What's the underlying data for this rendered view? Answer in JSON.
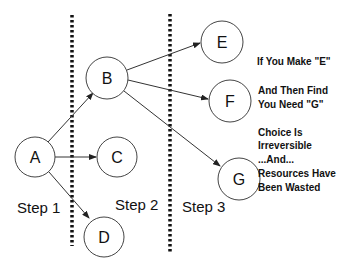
{
  "nodes": [
    {
      "id": "A",
      "label": "A",
      "cx": 35,
      "cy": 157,
      "r": 20
    },
    {
      "id": "B",
      "label": "B",
      "cx": 107,
      "cy": 78,
      "r": 21
    },
    {
      "id": "C",
      "label": "C",
      "cx": 117,
      "cy": 157,
      "r": 20
    },
    {
      "id": "D",
      "label": "D",
      "cx": 104,
      "cy": 237,
      "r": 20
    },
    {
      "id": "E",
      "label": "E",
      "cx": 222,
      "cy": 42,
      "r": 21
    },
    {
      "id": "F",
      "label": "F",
      "cx": 230,
      "cy": 101,
      "r": 21
    },
    {
      "id": "G",
      "label": "G",
      "cx": 239,
      "cy": 179,
      "r": 21
    }
  ],
  "edges": [
    {
      "from": "A",
      "to": "B"
    },
    {
      "from": "A",
      "to": "C"
    },
    {
      "from": "A",
      "to": "D"
    },
    {
      "from": "B",
      "to": "E"
    },
    {
      "from": "B",
      "to": "F"
    },
    {
      "from": "B",
      "to": "G"
    }
  ],
  "steps": [
    {
      "label": "Step 1",
      "x": 17,
      "y": 213
    },
    {
      "label": "Step 2",
      "x": 115,
      "y": 210
    },
    {
      "label": "Step 3",
      "x": 182,
      "y": 212
    }
  ],
  "dividers": [
    {
      "x": 72,
      "y1": 15,
      "y2": 246
    },
    {
      "x": 170,
      "y1": 14,
      "y2": 252
    }
  ],
  "notes": {
    "line1": "If You Make \"E\"",
    "line2": "And Then Find",
    "line3": "You Need \"G\"",
    "line4": "Choice Is",
    "line5": "Irreversible",
    "line6": "...And...",
    "line7": "Resources Have",
    "line8": "Been Wasted"
  }
}
